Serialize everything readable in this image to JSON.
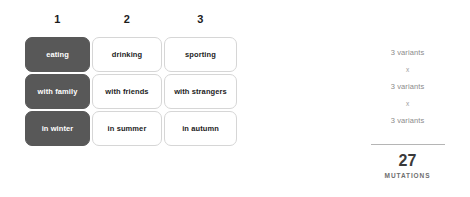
{
  "matrix": {
    "column_headers": [
      "1",
      "2",
      "3"
    ],
    "rows": [
      {
        "cells": [
          "eating",
          "drinking",
          "sporting"
        ]
      },
      {
        "cells": [
          "with family",
          "with friends",
          "with strangers"
        ]
      },
      {
        "cells": [
          "in winter",
          "in summer",
          "in autumn"
        ]
      }
    ]
  },
  "summary": {
    "variant_lines": [
      "3 variants",
      "3 variants",
      "3 variants"
    ],
    "operators": [
      "x",
      "x"
    ],
    "total_number": "27",
    "total_label": "MUTATIONS"
  },
  "colors": {
    "selected_cell_bg": "#585858",
    "selected_cell_text": "#ffffff",
    "cell_bg": "#ffffff",
    "cell_border": "#d6d6d6",
    "cell_text": "#1c1c1c",
    "muted_text": "#8b8b8b",
    "divider": "#b5b5b5",
    "page_bg": "#ffffff"
  }
}
